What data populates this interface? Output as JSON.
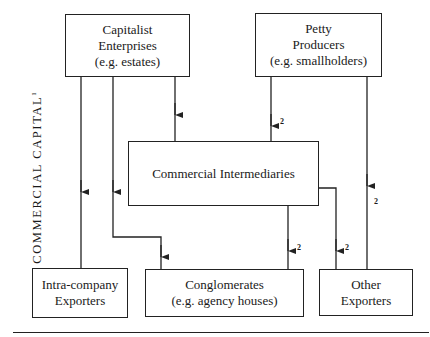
{
  "diagram": {
    "side_label": "COMMERCIAL CAPITAL",
    "side_label_superscript": "1",
    "nodes": {
      "capitalist": {
        "lines": [
          "Capitalist",
          "Enterprises",
          "(e.g. estates)"
        ]
      },
      "petty": {
        "lines": [
          "Petty",
          "Producers",
          "(e.g. smallholders)"
        ]
      },
      "intermediaries": {
        "lines": [
          "Commercial Intermediaries"
        ]
      },
      "intra": {
        "lines": [
          "Intra-company",
          "Exporters"
        ]
      },
      "conglomerates": {
        "lines": [
          "Conglomerates",
          "(e.g. agency houses)"
        ]
      },
      "other": {
        "lines": [
          "Other",
          "Exporters"
        ]
      }
    },
    "edges": [
      {
        "from": "Capitalist Enterprises",
        "to": "Intra-company Exporters",
        "note": ""
      },
      {
        "from": "Capitalist Enterprises",
        "to": "Conglomerates",
        "note": ""
      },
      {
        "from": "Capitalist Enterprises",
        "to": "Commercial Intermediaries",
        "note": ""
      },
      {
        "from": "Petty Producers",
        "to": "Commercial Intermediaries",
        "note": "2"
      },
      {
        "from": "Petty Producers",
        "to": "Other Exporters",
        "note": "2"
      },
      {
        "from": "Commercial Intermediaries",
        "to": "Conglomerates",
        "note": "2"
      },
      {
        "from": "Commercial Intermediaries",
        "to": "Other Exporters",
        "note": "2"
      }
    ],
    "footnote_marks": [
      "2",
      "2",
      "2",
      "2"
    ]
  }
}
